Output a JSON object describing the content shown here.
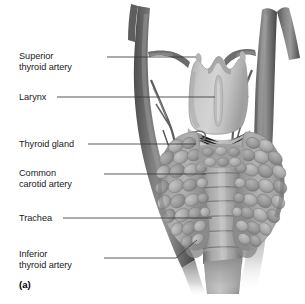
{
  "figure": {
    "caption": "(a)",
    "colors": {
      "background": "#ffffff",
      "label_text": "#1a1a1a",
      "leader_line": "#3a3a3a",
      "vessel_dark": "#6a6a6a",
      "vessel_shadow": "#4a4a4a",
      "vessel_highlight": "#9a9a9a",
      "larynx_light": "#c8c8c8",
      "larynx_shade": "#a8a8a8",
      "thyroid_mid": "#9d9d9d",
      "thyroid_lobule_light": "#b9b9b9",
      "thyroid_lobule_dark": "#7d7d7d",
      "trachea_ring": "#a5a5a5",
      "trachea_groove": "#6f6f6f",
      "muscle_tissue": "#bfbfbf"
    }
  },
  "labels": [
    {
      "id": "superior-thyroid-artery",
      "lines": "Superior\nthyroid artery",
      "leader_from": [
        107,
        57
      ],
      "leader_to": [
        196,
        57
      ]
    },
    {
      "id": "larynx",
      "lines": "Larynx",
      "leader_from": [
        57,
        97
      ],
      "leader_to": [
        215,
        97
      ]
    },
    {
      "id": "thyroid-gland",
      "lines": "Thyroid gland",
      "leader_from": [
        88,
        144
      ],
      "leader_to": [
        196,
        144
      ]
    },
    {
      "id": "common-carotid-artery",
      "lines": "Common\ncarotid artery",
      "leader_from": [
        104,
        174
      ],
      "leader_to": [
        206,
        174
      ]
    },
    {
      "id": "trachea",
      "lines": "Trachea",
      "leader_from": [
        63,
        218
      ],
      "leader_to": [
        212,
        218
      ]
    },
    {
      "id": "inferior-thyroid-artery",
      "lines": "Inferior\nthyroid artery",
      "leader_from": [
        104,
        258
      ],
      "leader_to": [
        196,
        241
      ]
    }
  ],
  "anatomy": {
    "larynx": {
      "name": "Thyroid cartilage of larynx",
      "top_notch": true
    },
    "thyroid_gland": {
      "name": "Thyroid gland",
      "lobes": 2,
      "isthmus": true
    },
    "trachea": {
      "name": "Trachea",
      "cartilage_rings": 8
    },
    "arteries": {
      "common_carotid_left": "Left common carotid artery",
      "common_carotid_right": "Right common carotid artery",
      "superior_thyroid": "Superior thyroid artery",
      "inferior_thyroid": "Inferior thyroid artery"
    }
  }
}
